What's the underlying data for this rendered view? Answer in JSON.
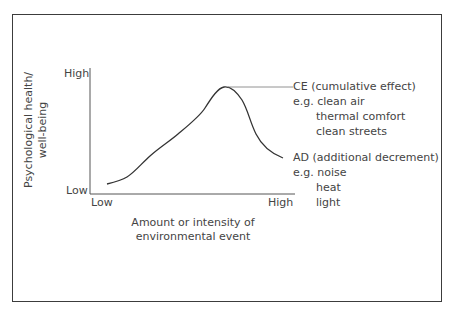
{
  "diagram": {
    "y_axis": {
      "label_line1": "Psychological health/",
      "label_line2": "well-being",
      "high_label": "High",
      "low_label": "Low"
    },
    "x_axis": {
      "label_line1": "Amount or intensity of",
      "label_line2": "environmental event",
      "low_label": "Low",
      "high_label": "High"
    },
    "annotations": {
      "ce": {
        "title": "CE (cumulative effect)",
        "examples": [
          "e.g. clean air",
          "thermal comfort",
          "clean streets"
        ]
      },
      "ad": {
        "title": "AD (additional decrement)",
        "examples": [
          "e.g. noise",
          "heat",
          "light"
        ]
      }
    },
    "colors": {
      "line": "#333333",
      "frame": "#3c3c3c",
      "text": "#444444"
    }
  }
}
